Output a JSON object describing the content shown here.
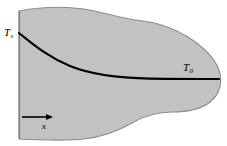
{
  "figure": {
    "caption_labels": {
      "surface_temperature": "T",
      "surface_temperature_subscript": "s",
      "ambient_temperature": "T",
      "ambient_temperature_subscript": "0",
      "axis_label": "x"
    },
    "colors": {
      "solid_fill": "#c2c2c2",
      "outline": "#8c8c8c",
      "curve": "#000000",
      "arrow": "#000000",
      "background": "#ffffff"
    },
    "geometry": {
      "left_face_x": 19,
      "left_face_top_y": 11,
      "left_face_bottom_y": 139,
      "curve_start": [
        19,
        33
      ],
      "curve_end": [
        219,
        79
      ],
      "arrow_start": [
        22,
        117
      ],
      "arrow_end": [
        53,
        117
      ],
      "right_extent_x": 221
    },
    "icons": {
      "x_direction_arrow": "arrow-right-icon"
    }
  }
}
